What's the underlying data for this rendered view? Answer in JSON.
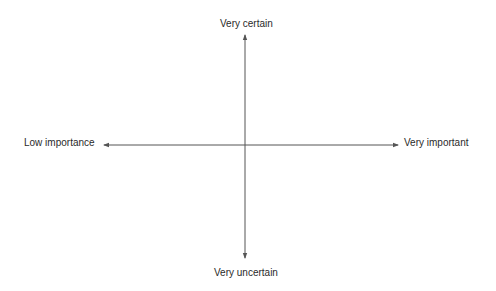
{
  "diagram": {
    "type": "quadrant-axes",
    "axes": {
      "vertical": {
        "top_label": "Very certain",
        "bottom_label": "Very uncertain"
      },
      "horizontal": {
        "left_label": "Low importance",
        "right_label": "Very important"
      }
    },
    "colors": {
      "line": "#555555",
      "text": "#2a2a2a",
      "background": "#ffffff"
    }
  }
}
